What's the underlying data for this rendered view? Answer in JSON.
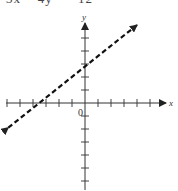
{
  "equation": "3x − 4y = −12",
  "axes": {
    "x_label": "x",
    "y_label": "y",
    "origin_label": "0",
    "origin_px": [
      85,
      103
    ],
    "unit_px": 13,
    "x_ticks": [
      -6,
      -5,
      -4,
      -3,
      -2,
      -1,
      1,
      2,
      3,
      4,
      5
    ],
    "y_ticks": [
      5,
      4,
      3,
      2,
      1,
      -1,
      -2,
      -3,
      -4,
      -5,
      -6
    ]
  },
  "chart_data": {
    "type": "line",
    "title": "3x − 4y = −12",
    "xlabel": "x",
    "ylabel": "y",
    "series": [
      {
        "name": "3x − 4y = −12 (dashed boundary)",
        "style": "dashed",
        "x": [
          -5.9,
          4
        ],
        "y": [
          -1.9,
          6
        ]
      }
    ],
    "x_intercept": -4,
    "y_intercept": 3,
    "slope": 0.75,
    "xlim": [
      -6.5,
      7
    ],
    "ylim": [
      -6.7,
      6.5
    ],
    "grid": false
  }
}
